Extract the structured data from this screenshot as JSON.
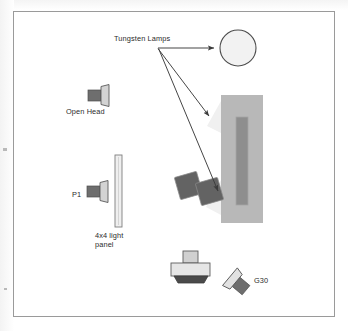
{
  "diagram": {
    "background_color": "#ffffff",
    "frame_color": "#9a9a9a",
    "labels": {
      "tungsten_lamps": "Tungsten Lamps",
      "open_head": "Open Head",
      "p1": "P1",
      "light_panel_line1": "4x4 light",
      "light_panel_line2": "panel",
      "g30": "G30"
    },
    "icons": {
      "open_head": "light-fixture-icon",
      "p1": "light-fixture-icon",
      "g30": "light-fixture-icon",
      "camera": "camera-icon",
      "panel": "light-panel-icon",
      "lamp_circle": "round-lamp-icon",
      "flags": "flag-panel-icon",
      "subject": "subject-block-icon"
    },
    "colors": {
      "fixture_body": "#6e6e6e",
      "fixture_front": "#d3d3d3",
      "outline": "#5a5a5a",
      "panel_fill": "#efefef",
      "subject_outer": "#b8b8b8",
      "subject_inner": "#8e8e8e",
      "flag_fill": "#636363",
      "glow": "#f0f0f0",
      "arrow": "#3b3b3b",
      "text": "#2b2b2b"
    },
    "arrows": [
      {
        "name": "arrow-to-round-lamp",
        "from": [
          158,
          48
        ],
        "to": [
          218,
          48
        ]
      },
      {
        "name": "arrow-to-subject-top",
        "from": [
          158,
          48
        ],
        "to": [
          213,
          119
        ]
      },
      {
        "name": "arrow-to-subject-lower",
        "from": [
          158,
          48
        ],
        "to": [
          222,
          194
        ]
      }
    ]
  }
}
